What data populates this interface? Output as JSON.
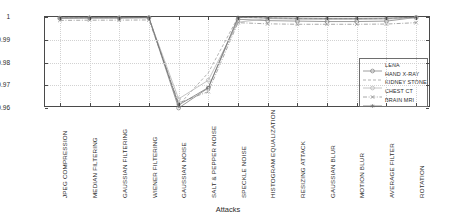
{
  "chart_data": {
    "type": "line",
    "title": "",
    "xlabel": "Attacks",
    "ylabel": "correlation coefficient",
    "ylim": [
      0.96,
      1.0
    ],
    "yticks": [
      0.96,
      0.97,
      0.98,
      0.99,
      1
    ],
    "ytick_labels": [
      "0.96",
      "0.97",
      "0.98",
      "0.99",
      "1"
    ],
    "grid": true,
    "legend_position": "lower-right-inside",
    "categories": [
      "JPEG COMPRESSION",
      "MEDIAN FILTERING",
      "GAUSSIAN FILTERING",
      "WIENER FILTERING",
      "GAUSSIAN NOISE",
      "SALT & PEPPER NOISE",
      "SPECKLE NOISE",
      "HISTOGRAM EQUALIZATION",
      "RESIZING ATTACK",
      "GAUSSIAN BLUR",
      "MOTION BLUR",
      "AVERAGE FILTER",
      "ROTATION"
    ],
    "series": [
      {
        "name": "LENA",
        "color": "#7d7d7d",
        "marker": "circle",
        "dash": "solid",
        "values": [
          0.9995,
          0.9996,
          0.9996,
          0.9997,
          0.9594,
          0.9688,
          0.999,
          0.9984,
          0.9982,
          0.998,
          0.998,
          0.9982,
          0.9998
        ]
      },
      {
        "name": "HAND X-RAY",
        "color": "#9a9a9a",
        "marker": "none",
        "dash": "dashed",
        "values": [
          0.9996,
          0.9997,
          0.9997,
          0.9998,
          0.9612,
          0.9755,
          0.9999,
          0.9996,
          0.9993,
          0.9992,
          0.9992,
          0.9993,
          0.9999
        ]
      },
      {
        "name": "KIDNEY STONE",
        "color": "#b0b0b0",
        "marker": "circle",
        "dash": "solid",
        "values": [
          0.9994,
          0.9995,
          0.9995,
          0.9996,
          0.964,
          0.9722,
          0.9977,
          0.9993,
          0.999,
          0.9989,
          0.9989,
          0.9991,
          0.9996
        ]
      },
      {
        "name": "CHEST CT",
        "color": "#8c8c8c",
        "marker": "x",
        "dash": "dash-dot",
        "values": [
          0.9985,
          0.9986,
          0.9986,
          0.9987,
          0.9622,
          0.9672,
          0.9975,
          0.997,
          0.9968,
          0.9968,
          0.9968,
          0.9969,
          0.9975
        ]
      },
      {
        "name": "BRAIN MRI",
        "color": "#6d6d6d",
        "marker": "star",
        "dash": "solid",
        "values": [
          0.9996,
          0.9997,
          0.9997,
          0.9998,
          0.9613,
          0.969,
          0.9998,
          0.9996,
          0.9995,
          0.9994,
          0.9994,
          0.9995,
          0.9999
        ]
      }
    ]
  }
}
